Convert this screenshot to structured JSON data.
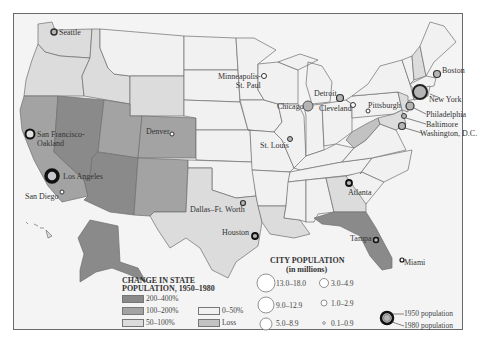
{
  "map": {
    "colors": {
      "frame": "#6a6a6a",
      "ocean": "#f4f4f4",
      "c200_400": "#8a8a8a",
      "c100_200": "#a3a3a3",
      "c50_100": "#dcdcdc",
      "c0_50": "#f1f1f1",
      "loss": "#c2c2c2",
      "border": "#6e6e6e",
      "city_fill": "#b5b5b5",
      "city_ring": "#333333"
    },
    "cities": [
      {
        "name": "Seattle"
      },
      {
        "name": "San Francisco-\nOakland",
        "line1": "San Francisco-",
        "line2": "Oakland"
      },
      {
        "name": "Los Angeles"
      },
      {
        "name": "San Diego"
      },
      {
        "name": "Denver"
      },
      {
        "name": "Minneapolis-St. Paul",
        "line1": "Minneapolis-",
        "line2": "St. Paul"
      },
      {
        "name": "Chicago"
      },
      {
        "name": "Detroit"
      },
      {
        "name": "Cleveland"
      },
      {
        "name": "St. Louis"
      },
      {
        "name": "Pittsburgh"
      },
      {
        "name": "Boston"
      },
      {
        "name": "New York"
      },
      {
        "name": "Philadelphia"
      },
      {
        "name": "Baltimore"
      },
      {
        "name": "Washington, D.C."
      },
      {
        "name": "Dallas–Ft. Worth"
      },
      {
        "name": "Houston"
      },
      {
        "name": "Atlanta"
      },
      {
        "name": "Tampa"
      },
      {
        "name": "Miami"
      }
    ]
  },
  "legend_state": {
    "title_line1": "CHANGE IN STATE",
    "title_line2": "POPULATION, 1950–1980",
    "items": [
      {
        "label": "200–400%",
        "color": "#8a8a8a"
      },
      {
        "label": "100–200%",
        "color": "#a3a3a3"
      },
      {
        "label": "50–100%",
        "color": "#dcdcdc"
      },
      {
        "label": "0–50%",
        "color": "#f1f1f1"
      },
      {
        "label": "Loss",
        "color": "#c2c2c2"
      }
    ]
  },
  "legend_city": {
    "title_line1": "CITY POPULATION",
    "title_line2": "(in millions)",
    "sizes": [
      {
        "label": "13.0–18.0"
      },
      {
        "label": "9.0–12.9"
      },
      {
        "label": "5.0–8.9"
      },
      {
        "label": "3.0–4.9"
      },
      {
        "label": "1.0–2.9"
      },
      {
        "label": "0.1–0.9"
      }
    ],
    "key_1950": "1950 population",
    "key_1980": "1980 population"
  }
}
